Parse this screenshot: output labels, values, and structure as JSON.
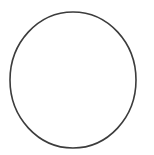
{
  "canvas": {
    "width": 154,
    "height": 155,
    "background_color": "#ffffff",
    "name": "circle-outline-drawing"
  },
  "shape": {
    "type": "ellipse",
    "name": "circle-outline",
    "center_x": 73,
    "center_y": 80,
    "radius_x": 63,
    "radius_y": 68,
    "stroke_color": "#3c3c3c",
    "stroke_width": 1.6,
    "fill_color": "none",
    "bounds": {
      "left": 10,
      "top": 12,
      "right": 136,
      "bottom": 148
    }
  }
}
